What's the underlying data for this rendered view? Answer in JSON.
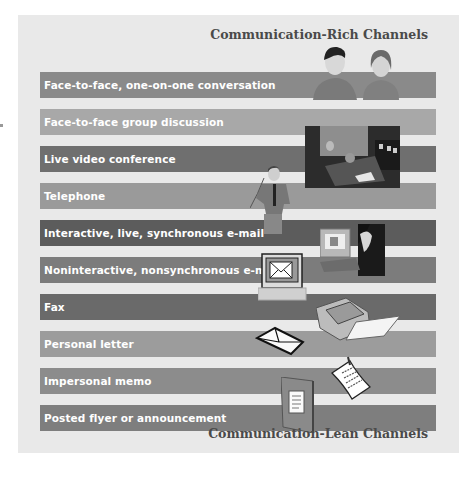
{
  "headings": {
    "top": "Communication-Rich Channels",
    "bottom": "Communication-Lean Channels"
  },
  "channels": [
    {
      "label": "Face-to-face, one-on-one conversation",
      "shade": "#8a8a8a"
    },
    {
      "label": "Face-to-face group discussion",
      "shade": "#a8a8a8"
    },
    {
      "label": "Live video conference",
      "shade": "#6f6f6f"
    },
    {
      "label": "Telephone",
      "shade": "#9a9a9a"
    },
    {
      "label": "Interactive, live, synchronous e-mail",
      "shade": "#5c5c5c"
    },
    {
      "label": "Noninteractive, nonsynchronous e-mail",
      "shade": "#7c7c7c"
    },
    {
      "label": "Fax",
      "shade": "#6a6a6a"
    },
    {
      "label": "Personal letter",
      "shade": "#9c9c9c"
    },
    {
      "label": "Impersonal memo",
      "shade": "#8c8c8c"
    },
    {
      "label": "Posted flyer or announcement",
      "shade": "#7e7e7e"
    }
  ],
  "illustrations": [
    "two-people-talking",
    "video-conference-room",
    "man-on-telephone",
    "person-at-computer-video-chat",
    "computer-with-envelope",
    "fax-machine",
    "envelope",
    "pinned-memo",
    "folder-with-document"
  ]
}
